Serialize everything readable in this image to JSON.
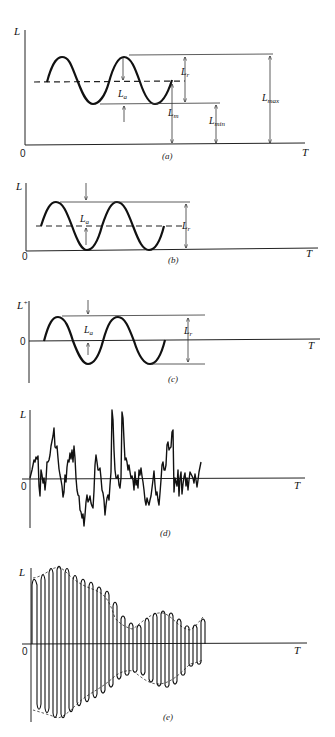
{
  "figure": {
    "panels": [
      {
        "id": "a",
        "caption": "(a)",
        "y_axis_label": "L",
        "x_axis_label": "T",
        "origin_label": "0",
        "description": "Sinusoidal load with positive mean; annotated range, alternating, mean, min and max",
        "annotations": {
          "range": "L",
          "range_sub": "r",
          "alternating": "L",
          "alternating_sub": "a",
          "mean": "L",
          "mean_sub": "m",
          "min": "L",
          "min_sub": "min",
          "max": "L",
          "max_sub": "max"
        }
      },
      {
        "id": "b",
        "caption": "(b)",
        "y_axis_label": "L",
        "x_axis_label": "T",
        "origin_label": "0",
        "description": "Sinusoidal load with minimum at zero",
        "annotations": {
          "alternating": "L",
          "alternating_sub": "a",
          "range": "L",
          "range_sub": "r"
        }
      },
      {
        "id": "c",
        "caption": "(c)",
        "y_axis_label": "L",
        "y_axis_sup": "+",
        "x_axis_label": "T",
        "origin_label": "0",
        "description": "Fully reversed sinusoidal load (zero mean)",
        "annotations": {
          "alternating": "L",
          "alternating_sub": "a",
          "range": "L",
          "range_sub": "r"
        }
      },
      {
        "id": "d",
        "caption": "(d)",
        "y_axis_label": "L",
        "x_axis_label": "T",
        "origin_label": "0",
        "description": "Random load history"
      },
      {
        "id": "e",
        "caption": "(e)",
        "y_axis_label": "L",
        "x_axis_label": "T",
        "origin_label": "0",
        "description": "Narrow-band random load with varying amplitude envelope"
      }
    ]
  }
}
